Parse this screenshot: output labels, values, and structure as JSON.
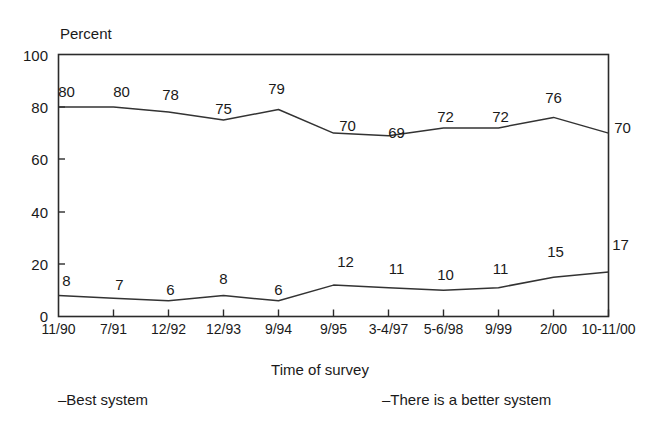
{
  "top_crop_fragment": "",
  "chart_data": {
    "type": "line",
    "title": "",
    "xlabel": "Time of survey",
    "ylabel": "Percent",
    "ylim": [
      0,
      100
    ],
    "yticks": [
      0,
      20,
      40,
      60,
      80,
      100
    ],
    "ytick_labels": [
      "0",
      "20",
      "40",
      "60",
      "80",
      "100"
    ],
    "grid": false,
    "legend_position": "bottom",
    "categories": [
      "11/90",
      "7/91",
      "12/92",
      "12/93",
      "9/94",
      "9/95",
      "3-4/97",
      "5-6/98",
      "9/99",
      "2/00",
      "10-11/00"
    ],
    "series": [
      {
        "name": "Best system",
        "legend_label": "–Best system",
        "values": [
          80,
          80,
          78,
          75,
          79,
          70,
          69,
          72,
          72,
          76,
          70
        ],
        "color": "#333333"
      },
      {
        "name": "There is a better system",
        "legend_label": "–There is a better system",
        "values": [
          8,
          7,
          6,
          8,
          6,
          12,
          11,
          10,
          11,
          15,
          17
        ],
        "color": "#333333"
      }
    ],
    "data_labels": {
      "best_system": [
        "80",
        "80",
        "78",
        "75",
        "79",
        "70",
        "69",
        "72",
        "72",
        "76",
        "70"
      ],
      "better_system": [
        "8",
        "7",
        "6",
        "8",
        "6",
        "12",
        "11",
        "10",
        "11",
        "15",
        "17"
      ]
    }
  }
}
